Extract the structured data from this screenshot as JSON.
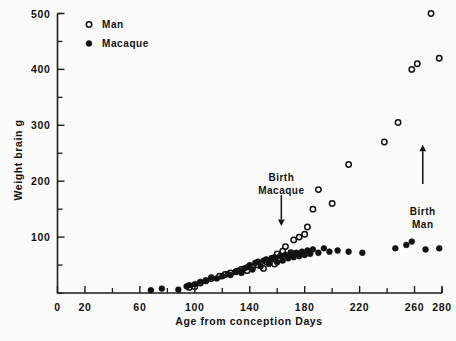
{
  "chart_data": {
    "type": "scatter",
    "title": "",
    "xlabel": "Age from conception   Days",
    "ylabel": "Weight brain  g",
    "xlim": [
      0,
      280
    ],
    "ylim": [
      0,
      500
    ],
    "grid": false,
    "legend_position": "top-left-inside",
    "xticks": [
      0,
      20,
      40,
      60,
      80,
      100,
      120,
      140,
      160,
      180,
      200,
      220,
      240,
      260,
      280
    ],
    "xtick_labels": [
      "0",
      "20",
      "",
      "60",
      "",
      "100",
      "",
      "140",
      "",
      "180",
      "",
      "220",
      "",
      "260",
      "280"
    ],
    "yticks": [
      0,
      50,
      100,
      150,
      200,
      250,
      300,
      350,
      400,
      450,
      500
    ],
    "ytick_labels": [
      "",
      "",
      "100",
      "",
      "200",
      "",
      "300",
      "",
      "400",
      "",
      "500"
    ],
    "series": [
      {
        "name": "Man",
        "marker": "open-circle",
        "color": "#111111",
        "points": [
          [
            96,
            10
          ],
          [
            100,
            11
          ],
          [
            104,
            18
          ],
          [
            108,
            22
          ],
          [
            112,
            26
          ],
          [
            118,
            30
          ],
          [
            122,
            33
          ],
          [
            126,
            36
          ],
          [
            130,
            38
          ],
          [
            134,
            42
          ],
          [
            138,
            40
          ],
          [
            142,
            46
          ],
          [
            146,
            50
          ],
          [
            150,
            44
          ],
          [
            152,
            56
          ],
          [
            156,
            62
          ],
          [
            158,
            52
          ],
          [
            160,
            70
          ],
          [
            162,
            60
          ],
          [
            164,
            75
          ],
          [
            166,
            83
          ],
          [
            170,
            72
          ],
          [
            172,
            95
          ],
          [
            176,
            100
          ],
          [
            180,
            105
          ],
          [
            182,
            118
          ],
          [
            186,
            150
          ],
          [
            190,
            185
          ],
          [
            200,
            160
          ],
          [
            212,
            230
          ],
          [
            238,
            270
          ],
          [
            248,
            305
          ],
          [
            258,
            400
          ],
          [
            262,
            410
          ],
          [
            272,
            500
          ],
          [
            278,
            420
          ]
        ]
      },
      {
        "name": "Macaque",
        "marker": "filled-circle",
        "color": "#111111",
        "points": [
          [
            68,
            5
          ],
          [
            76,
            8
          ],
          [
            88,
            6
          ],
          [
            94,
            12
          ],
          [
            96,
            14
          ],
          [
            100,
            16
          ],
          [
            104,
            20
          ],
          [
            108,
            22
          ],
          [
            112,
            28
          ],
          [
            116,
            26
          ],
          [
            120,
            30
          ],
          [
            124,
            34
          ],
          [
            126,
            32
          ],
          [
            130,
            38
          ],
          [
            132,
            40
          ],
          [
            134,
            36
          ],
          [
            136,
            44
          ],
          [
            138,
            46
          ],
          [
            140,
            50
          ],
          [
            142,
            42
          ],
          [
            144,
            54
          ],
          [
            146,
            56
          ],
          [
            148,
            48
          ],
          [
            150,
            58
          ],
          [
            152,
            60
          ],
          [
            154,
            52
          ],
          [
            156,
            62
          ],
          [
            158,
            64
          ],
          [
            160,
            55
          ],
          [
            162,
            66
          ],
          [
            164,
            58
          ],
          [
            166,
            68
          ],
          [
            168,
            62
          ],
          [
            170,
            70
          ],
          [
            172,
            64
          ],
          [
            174,
            72
          ],
          [
            176,
            66
          ],
          [
            178,
            74
          ],
          [
            180,
            68
          ],
          [
            182,
            76
          ],
          [
            184,
            70
          ],
          [
            186,
            78
          ],
          [
            190,
            72
          ],
          [
            194,
            80
          ],
          [
            198,
            74
          ],
          [
            204,
            76
          ],
          [
            212,
            74
          ],
          [
            222,
            72
          ],
          [
            246,
            80
          ],
          [
            254,
            86
          ],
          [
            258,
            92
          ],
          [
            268,
            78
          ],
          [
            278,
            80
          ]
        ]
      }
    ],
    "annotations": [
      {
        "id": "birth-macaque",
        "text_line1": "Birth",
        "text_line2": "Macaque",
        "arrow_direction": "down",
        "x": 163,
        "y_text": 200,
        "arrow_from_y": 175,
        "arrow_to_y": 120
      },
      {
        "id": "birth-man",
        "text_line1": "Birth",
        "text_line2": "Man",
        "arrow_direction": "up",
        "x": 266,
        "y_text": 140,
        "arrow_from_y": 195,
        "arrow_to_y": 265
      }
    ]
  },
  "legend": {
    "items": [
      {
        "label": "Man",
        "marker": "open-circle"
      },
      {
        "label": "Macaque",
        "marker": "filled-circle"
      }
    ]
  }
}
